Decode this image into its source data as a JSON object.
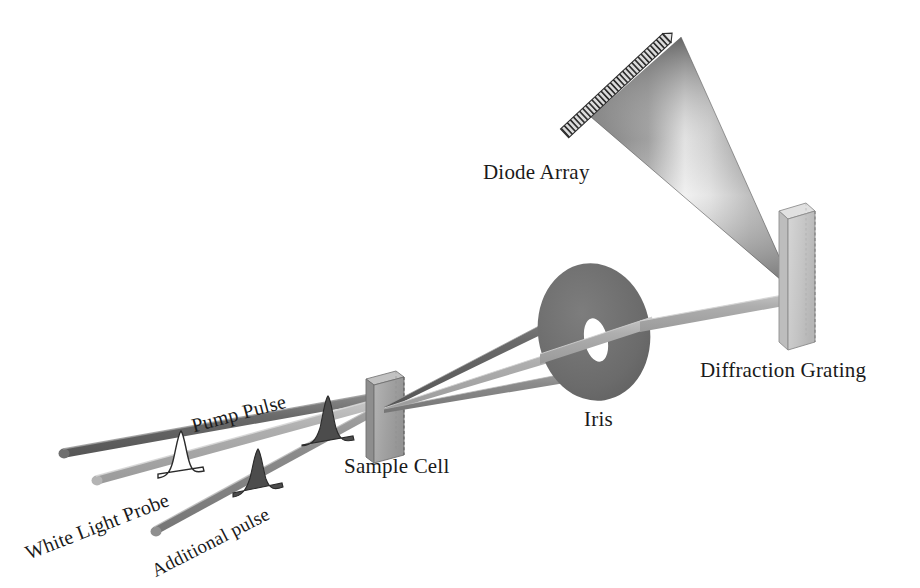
{
  "figure": {
    "background_color": "#ffffff"
  },
  "labels": {
    "pump_pulse": "Pump Pulse",
    "white_light_probe": "White Light Probe",
    "additional_pulse": "Additional pulse",
    "sample_cell": "Sample Cell",
    "iris": "Iris",
    "diffraction_grating": "Diffraction Grating",
    "diode_array": "Diode Array"
  },
  "colors": {
    "pump_beam": "#6b6b6b",
    "probe_beam": "#a9a9a9",
    "additional_beam": "#8c8c8c",
    "sample_cell_face": "#a6a6a6",
    "sample_cell_edge": "#6f6f6f",
    "iris_disc": "#6e6e6e",
    "iris_aperture": "#ffffff",
    "grating_face": "#c7c7c7",
    "grating_edge": "#8a8a8a",
    "dispersed_fan_dark": "#6a6a6a",
    "dispersed_fan_light": "#e0e0e0",
    "diode_array_body": "#d8d8d8",
    "diode_array_stripe": "#3a3a3a",
    "pulse_fill_dark": "#4a4a4a",
    "pulse_fill_white": "#ffffff",
    "pulse_outline": "#2b2b2b",
    "text": "#1a1a1a"
  },
  "components": [
    {
      "name": "pump-pulse-beam",
      "kind": "beam",
      "shade": "dark",
      "start": [
        60,
        447
      ],
      "end": [
        380,
        395
      ],
      "has_gaussian_pulse": true,
      "pulse_fill": "dark"
    },
    {
      "name": "white-light-probe-beam",
      "kind": "beam",
      "shade": "light",
      "start": [
        92,
        473
      ],
      "end": [
        380,
        400
      ],
      "has_gaussian_pulse": true,
      "pulse_fill": "white"
    },
    {
      "name": "additional-pulse-beam",
      "kind": "beam",
      "shade": "medium",
      "start": [
        150,
        524
      ],
      "end": [
        380,
        404
      ],
      "has_gaussian_pulse": true,
      "pulse_fill": "dark"
    },
    {
      "name": "sample-cell",
      "kind": "slab",
      "position": [
        362,
        374
      ],
      "size": [
        38,
        84
      ]
    },
    {
      "name": "iris",
      "kind": "apertured-disc",
      "center": [
        594,
        332
      ],
      "radius": [
        56,
        70
      ],
      "aperture_radius": [
        11,
        22
      ]
    },
    {
      "name": "diffraction-grating",
      "kind": "slab",
      "position": [
        782,
        205
      ],
      "size": [
        32,
        145
      ]
    },
    {
      "name": "diode-array",
      "kind": "striped-bar",
      "start": [
        568,
        133
      ],
      "end": [
        668,
        40
      ],
      "stripe_count": 34
    },
    {
      "name": "dispersed-light-fan",
      "kind": "gradient-cone",
      "apex": [
        793,
        288
      ],
      "spread_start": [
        590,
        116
      ],
      "spread_end": [
        680,
        36
      ]
    }
  ],
  "beam_paths": [
    {
      "name": "sample-to-iris-upper",
      "from": "sample-cell",
      "to": "iris",
      "shade": "dark",
      "blocked": true
    },
    {
      "name": "sample-to-iris-probe",
      "from": "sample-cell",
      "to": "iris-aperture",
      "shade": "light",
      "blocked": false
    },
    {
      "name": "sample-to-iris-lower",
      "from": "sample-cell",
      "to": "iris",
      "shade": "medium",
      "blocked": true
    },
    {
      "name": "iris-to-grating",
      "from": "iris-aperture",
      "to": "diffraction-grating",
      "shade": "light",
      "blocked": false
    },
    {
      "name": "grating-to-diode-array",
      "from": "diffraction-grating",
      "to": "diode-array",
      "shade": "gradient",
      "blocked": false
    }
  ],
  "label_positions": {
    "pump_pulse": {
      "x": 189,
      "y": 415,
      "size": 20
    },
    "white_light_probe": {
      "x": 22,
      "y": 543,
      "size": 20
    },
    "additional_pulse": {
      "x": 148,
      "y": 562,
      "size": 19
    },
    "sample_cell": {
      "x": 344,
      "y": 454,
      "size": 21
    },
    "iris": {
      "x": 584,
      "y": 407,
      "size": 21
    },
    "diffraction_grating": {
      "x": 700,
      "y": 358,
      "size": 21
    },
    "diode_array": {
      "x": 483,
      "y": 160,
      "size": 21
    }
  }
}
